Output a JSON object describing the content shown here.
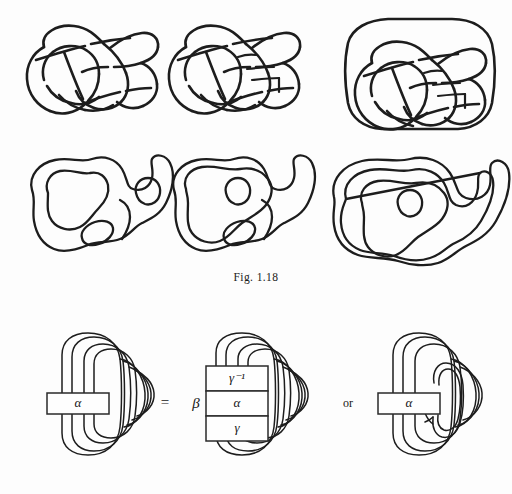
{
  "page": {
    "page_number": "",
    "background_color": "#fdfdfd",
    "ink_color": "#1d1d1d"
  },
  "figure_caption": {
    "text": "Fig. 1.18"
  },
  "top_row": {
    "name": "knot-diagrams-row",
    "items": [
      {
        "label": "knot-diagram-1",
        "description": "hand-drawn knot projection"
      },
      {
        "label": "knot-diagram-2",
        "description": "hand-drawn knot projection with extra crossings"
      },
      {
        "label": "knot-diagram-3",
        "description": "hand-drawn knot projection enclosed by outer loop"
      }
    ]
  },
  "middle_row": {
    "name": "surface-diagrams-row",
    "items": [
      {
        "label": "surface-diagram-1",
        "description": "blob outline with two inner holes"
      },
      {
        "label": "surface-diagram-2",
        "description": "blob outline with two inner holes, nested band"
      },
      {
        "label": "surface-diagram-3",
        "description": "blob outline with one inner hole, doubled boundary"
      }
    ]
  },
  "equation": {
    "name": "tangle-equation",
    "equals_sign": "=",
    "or_text": "or",
    "left_tangle": {
      "name": "left-tangle",
      "box_label": "α"
    },
    "middle_tangle": {
      "name": "middle-tangle",
      "outer_label": "β",
      "boxes": [
        {
          "name": "gamma-inverse-box",
          "label": "γ⁻¹"
        },
        {
          "name": "alpha-box",
          "label": "α"
        },
        {
          "name": "gamma-box",
          "label": "γ"
        }
      ]
    },
    "right_tangle": {
      "name": "right-tangle",
      "box_label": "α"
    }
  }
}
